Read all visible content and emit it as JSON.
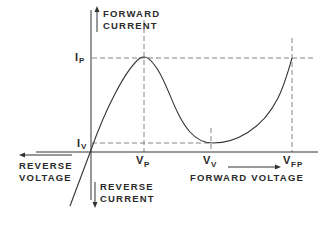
{
  "diagram": {
    "type": "tunnel-diode-iv-characteristic",
    "colors": {
      "line": "#333333",
      "dash": "#777777",
      "text": "#2a2a2a",
      "background": "#ffffff"
    },
    "axes": {
      "y_positive_label_line1": "FORWARD",
      "y_positive_label_line2": "CURRENT",
      "y_negative_label_line1": "REVERSE",
      "y_negative_label_line2": "CURRENT",
      "x_negative_label_line1": "REVERSE",
      "x_negative_label_line2": "VOLTAGE",
      "x_positive_label": "FORWARD VOLTAGE"
    },
    "markers": {
      "ip": {
        "main": "I",
        "sub": "P"
      },
      "iv": {
        "main": "I",
        "sub": "V"
      },
      "vp": {
        "main": "V",
        "sub": "P"
      },
      "vv": {
        "main": "V",
        "sub": "V"
      },
      "vfp": {
        "main": "V",
        "sub": "FP"
      }
    },
    "curve_points_description": [
      "origin",
      "peak (VP, IP)",
      "valley (VV, IV)",
      "forward peak (VFP, IP)"
    ]
  }
}
